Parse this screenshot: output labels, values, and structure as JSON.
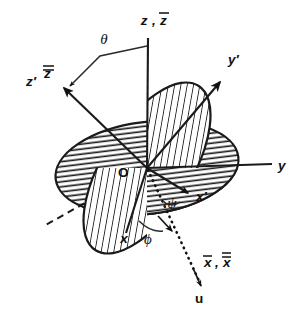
{
  "figure": {
    "kind": "euler-angle-diagram",
    "background_color": "#ffffff",
    "ink_color": "#111111",
    "canvas": {
      "width": 301,
      "height": 310
    }
  },
  "labels": {
    "z_axis": "z , z̅",
    "z_axis_plain": "z",
    "z_axis_bar": "z̅",
    "theta": "θ",
    "z_prime": "z′",
    "z_double_bar": "z̅̅",
    "y_prime": "y′",
    "y_axis": "y",
    "origin": "O",
    "psi": "ψ",
    "x_prime": "x′",
    "x_axis": "x",
    "phi": "ϕ",
    "x_bars": "x̅ , x̅̅",
    "x_single_bar": "x̅",
    "x_double_bar": "x̅̅",
    "u_axis": "u"
  },
  "planes": [
    {
      "name": "space-fixed-xy-plane",
      "hatch": "horizontal",
      "tilt_deg": -7,
      "center": [
        147,
        168
      ],
      "radii": [
        92,
        46
      ]
    },
    {
      "name": "body-fixed-xprime-yprime-plane",
      "hatch": "diagonal-steep",
      "tilt_deg": -58,
      "center": [
        147,
        168
      ],
      "radii": [
        97,
        44
      ]
    }
  ],
  "axes": [
    {
      "name": "z-axis",
      "label": "z , z̅",
      "from": [
        147,
        168
      ],
      "to": [
        148,
        38
      ],
      "arrow": false,
      "style": "solid"
    },
    {
      "name": "z-prime-axis",
      "label": "z′ , z̅̅",
      "from": [
        147,
        168
      ],
      "to": [
        62,
        86
      ],
      "arrow": true,
      "style": "solid"
    },
    {
      "name": "y-axis",
      "label": "y",
      "from": [
        147,
        168
      ],
      "to": [
        272,
        164
      ],
      "arrow": false,
      "style": "solid"
    },
    {
      "name": "y-prime-axis",
      "label": "y′",
      "from": [
        147,
        168
      ],
      "to": [
        222,
        80
      ],
      "arrow": true,
      "style": "solid"
    },
    {
      "name": "x-axis",
      "label": "x",
      "from": [
        147,
        168
      ],
      "to": [
        127,
        234
      ],
      "arrow": false,
      "style": "solid"
    },
    {
      "name": "x-prime-axis",
      "label": "x′",
      "from": [
        147,
        168
      ],
      "to": [
        192,
        196
      ],
      "arrow": true,
      "style": "solid"
    },
    {
      "name": "line-of-nodes-u-axis",
      "label": "u",
      "from": [
        147,
        168
      ],
      "to": [
        203,
        288
      ],
      "arrow": true,
      "style": "dotted"
    },
    {
      "name": "node-line-back-dashed",
      "label": "",
      "from": [
        147,
        168
      ],
      "to": [
        44,
        226
      ],
      "arrow": false,
      "style": "dashed"
    }
  ],
  "angles": [
    {
      "name": "theta-angle",
      "symbol": "θ",
      "between": [
        "z-axis",
        "z-prime-axis"
      ]
    },
    {
      "name": "phi-angle",
      "symbol": "ϕ",
      "between": [
        "x-axis",
        "u-axis"
      ]
    },
    {
      "name": "psi-angle",
      "symbol": "ψ",
      "between": [
        "u-axis",
        "x-prime-axis"
      ]
    }
  ]
}
